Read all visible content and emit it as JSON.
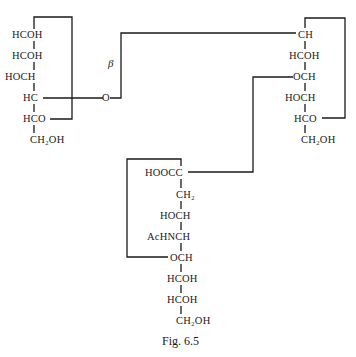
{
  "figure": {
    "caption": "Fig. 6.5",
    "beta_label": "β",
    "glycoside_oxygen": "O",
    "left_ring": {
      "rows": [
        "HCOH",
        "HCOH",
        "HOCH",
        "HC",
        "HCO",
        "CH₂OH"
      ]
    },
    "right_ring": {
      "rows": [
        "CH",
        "HCOH",
        "OCH",
        "HOCH",
        "HCO",
        "CH₂OH"
      ]
    },
    "sialic_ring": {
      "rows": [
        "HOOCC",
        "CH₂",
        "HOCH",
        "AcHNCH",
        "OCH",
        "HCOH",
        "HCOH",
        "CH₂OH"
      ]
    }
  }
}
